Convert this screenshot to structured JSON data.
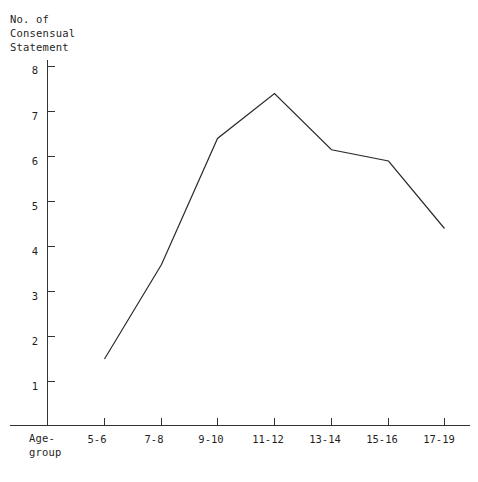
{
  "chart_data": {
    "type": "line",
    "title": "",
    "ylabel": "No. of\nConsensual\nStatement",
    "xlabel": "Age-\ngroup",
    "categories": [
      "5-6",
      "7-8",
      "9-10",
      "11-12",
      "13-14",
      "15-16",
      "17-19"
    ],
    "values": [
      1.5,
      3.6,
      6.4,
      7.4,
      6.15,
      5.9,
      4.4
    ],
    "series": [
      {
        "name": "No. of Consensual Statement",
        "values": [
          1.5,
          3.6,
          6.4,
          7.4,
          6.15,
          5.9,
          4.4
        ]
      }
    ],
    "ylim": [
      0,
      8
    ],
    "y_ticks": [
      "1",
      "2",
      "3",
      "4",
      "5",
      "6",
      "7",
      "8"
    ],
    "y_tick_values": [
      1,
      2,
      3,
      4,
      5,
      6,
      7,
      8
    ],
    "grid": false,
    "legend": "none",
    "line_color": "#2b2b2b",
    "axis_color": "#333333"
  },
  "axes": {
    "y_title_lines": [
      "No. of",
      "Consensual",
      "Statement"
    ],
    "x_title_lines": [
      "Age-",
      "group"
    ]
  }
}
